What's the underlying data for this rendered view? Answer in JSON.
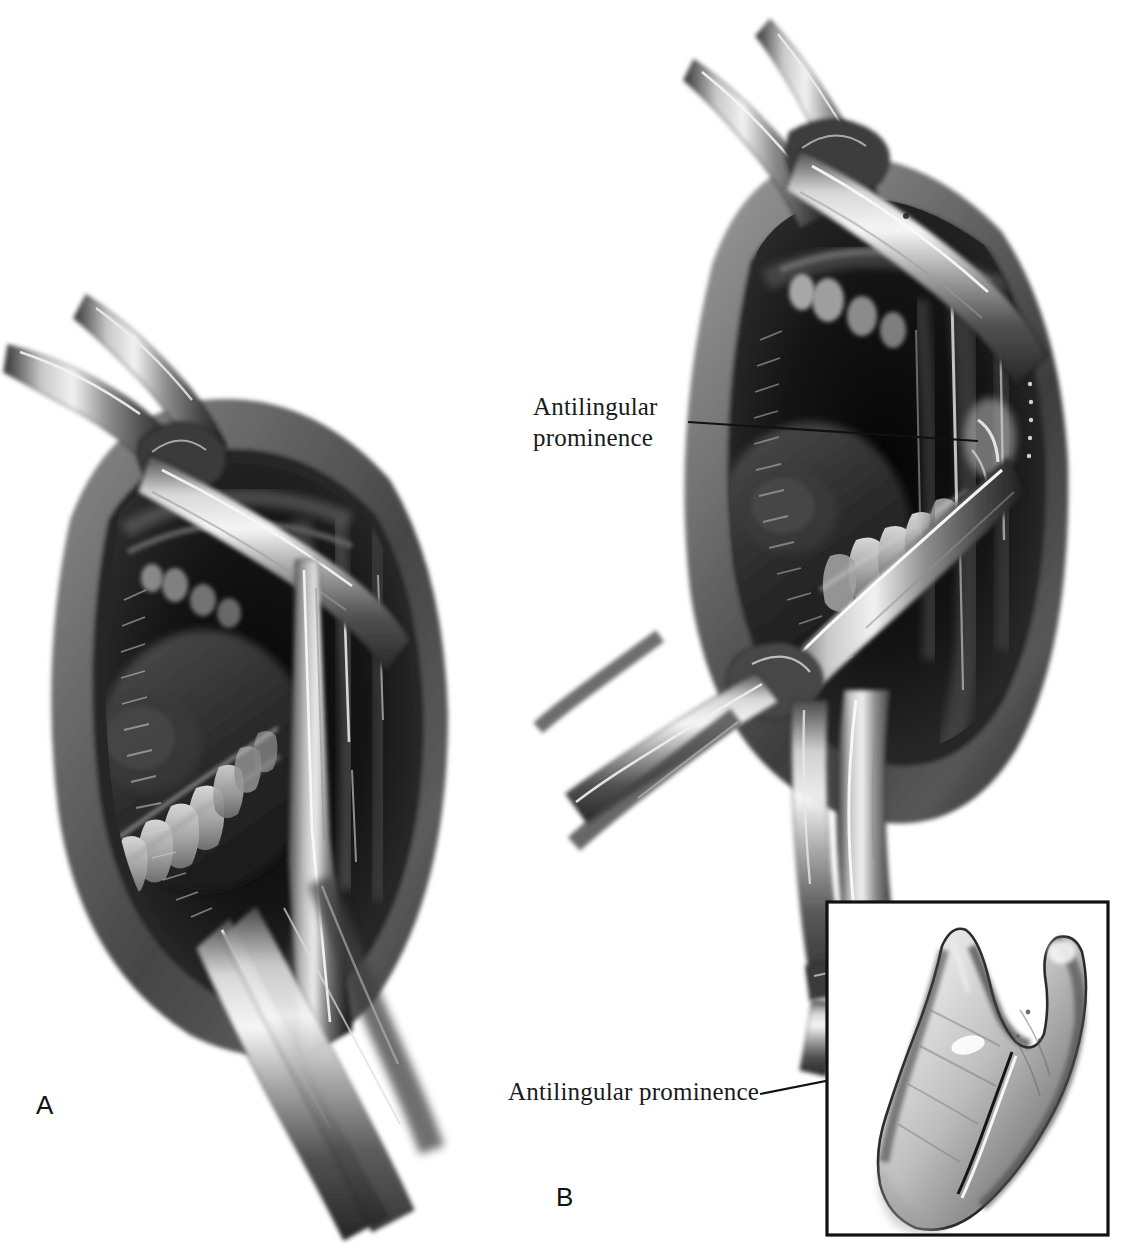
{
  "figure": {
    "medium": "grayscale surgical illustration",
    "background_color": "#ffffff",
    "ink_color": "#111111",
    "panels": [
      {
        "id": "A",
        "letter": "A",
        "description": "Intraoral view of the open mouth retracted with a cheek retractor; a periosteal elevator and retractor expose the anterior border of the mandibular ramus."
      },
      {
        "id": "B",
        "letter": "B",
        "description": "Intraoral view with retractor and curved osteotomy instrument seated on the medial ramus at the antilingular prominence; second instrument shown below."
      }
    ],
    "annotations": [
      {
        "id": "antilingular-prominence-panel-b",
        "text": "Antilingular\nprominence",
        "lines": [
          "Antilingular",
          "prominence"
        ],
        "leader": {
          "from_x": 688,
          "from_y": 422,
          "to_x": 978,
          "to_y": 441
        }
      },
      {
        "id": "antilingular-prominence-inset",
        "text": "Antilingular prominence",
        "lines": [
          "Antilingular prominence"
        ],
        "leader": {
          "from_x": 760,
          "from_y": 1094,
          "to_x": 972,
          "to_y": 1052
        }
      }
    ],
    "inset": {
      "id": "ramus-bone-inset",
      "description": "Lateral view of an isolated mandibular ramus specimen showing the coronoid process, sigmoid notch, condyle and the antilingular prominence ridge.",
      "border_color": "#111111",
      "border_width_px": 3,
      "bounds": {
        "x": 827,
        "y": 902,
        "width": 281,
        "height": 333
      }
    }
  }
}
